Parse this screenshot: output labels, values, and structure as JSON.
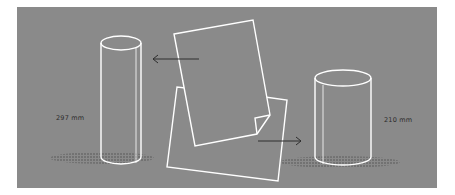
{
  "diagram": {
    "background_color": "#8a8a8a",
    "line_color": "#ffffff",
    "arrow_color": "#2e2e2e",
    "left_cylinder": {
      "label": "297 mm",
      "description": "tall narrow cylinder (paper rolled along long edge)"
    },
    "right_cylinder": {
      "label": "210 mm",
      "description": "short wide cylinder (paper rolled along short edge)"
    },
    "sheets": {
      "description": "two overlapping A4 sheets, top one with folded corner"
    },
    "arrows": [
      {
        "direction": "left",
        "points_to": "left_cylinder"
      },
      {
        "direction": "right",
        "points_to": "right_cylinder"
      }
    ]
  }
}
